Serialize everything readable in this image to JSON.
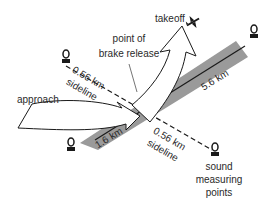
{
  "diagram": {
    "labels": {
      "takeoff": "takeoff",
      "point_of_brake_release_line1": "point of",
      "point_of_brake_release_line2": "brake release",
      "approach": "approach",
      "sideline_upper_distance": "0.56 km",
      "sideline_upper_word": "sideline",
      "sideline_lower_distance": "0.56 km",
      "sideline_lower_word": "sideline",
      "runway_takeoff_distance": "5.6 km",
      "runway_approach_distance": "1.6 km",
      "sound_measuring_points_line1": "sound",
      "sound_measuring_points_line2": "measuring",
      "sound_measuring_points_line3": "points"
    },
    "icons": {
      "airplane": "airplane-icon",
      "microphone": "microphone-icon"
    },
    "colors": {
      "runway": "#9a9a9a",
      "outline": "#1a1a1a",
      "arrow_fill": "#ffffff",
      "text": "#2a2a2a"
    }
  }
}
